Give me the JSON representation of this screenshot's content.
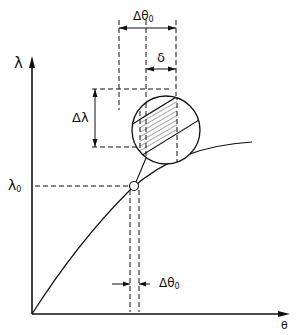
{
  "diagram": {
    "axes": {
      "x_label": "θ",
      "y_label": "λ"
    },
    "labels": {
      "lambda0": {
        "base": "λ",
        "sub": "0"
      },
      "delta_lambda": "Δλ",
      "delta_theta0_top": {
        "base": "Δθ",
        "sub": "0"
      },
      "delta_theta0_bottom": {
        "base": "Δθ",
        "sub": "0"
      },
      "delta": "δ"
    },
    "elements": [
      "y-axis with arrow (λ)",
      "x-axis with arrow (θ)",
      "concave increasing curve from origin",
      "operating point circle at (θ0, λ0)",
      "magnified detail circle with hatched band",
      "dimension Δλ",
      "dimension Δθ0 (top and bottom)",
      "dimension δ"
    ],
    "colors": {
      "ink": "#111111",
      "background": "#ffffff"
    }
  }
}
